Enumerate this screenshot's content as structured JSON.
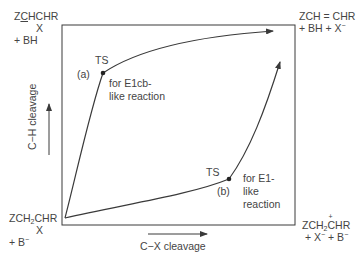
{
  "corners": {
    "top_left": {
      "line1_pre": "Z",
      "line1_underlined": "C",
      "line1_post": "HCHR",
      "line2": "X",
      "line3": "+ BH"
    },
    "top_right": {
      "line1": "ZCH = CHR",
      "line2_pre": "+ BH + X",
      "line2_sup": "−"
    },
    "bottom_left": {
      "line1_pre": "ZCH",
      "line1_sub": "2",
      "line1_post": "CHR",
      "line2": "X",
      "line3_pre": "+ B",
      "line3_sup": "−"
    },
    "bottom_right": {
      "line1_pre": "ZCH",
      "line1_sub": "2",
      "line1_charged": "C",
      "line1_post": "HR",
      "line2_pre": "+ X",
      "line2_sup1": "−",
      "line2_mid": " + B",
      "line2_sup2": "−"
    }
  },
  "axes": {
    "y_label": "C−H cleavage",
    "x_label": "C−X cleavage"
  },
  "paths": {
    "a": {
      "ts_label": "TS",
      "tag": "(a)",
      "description_line1": "for E1cb-",
      "description_line2": "like reaction"
    },
    "b": {
      "ts_label": "TS",
      "tag": "(b)",
      "description_line1": "for E1-",
      "description_line2": "like",
      "description_line3": "reaction"
    }
  },
  "colors": {
    "line": "#3a3a3a",
    "text": "#444444",
    "background": "#ffffff"
  }
}
